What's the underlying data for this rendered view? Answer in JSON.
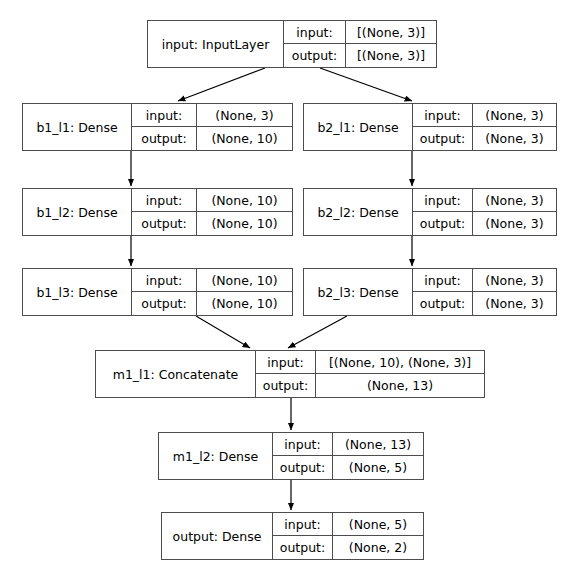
{
  "diagram": {
    "type": "keras-model-graph",
    "background_color": "#ffffff",
    "border_color": "#4d4d4d",
    "text_color": "#000000",
    "io_labels": {
      "input": "input:",
      "output": "output:"
    },
    "nodes": [
      {
        "id": "input",
        "name": "input: InputLayer",
        "input_shape": "[(None, 3)]",
        "output_shape": "[(None, 3)]",
        "x": 147,
        "y": 20,
        "w": 290,
        "h": 48,
        "name_w": 136,
        "label_w": 62
      },
      {
        "id": "b1_l1",
        "name": "b1_l1: Dense",
        "input_shape": "(None, 3)",
        "output_shape": "(None, 10)",
        "x": 22,
        "y": 103,
        "w": 271,
        "h": 48,
        "name_w": 109,
        "label_w": 65
      },
      {
        "id": "b2_l1",
        "name": "b2_l1: Dense",
        "input_shape": "(None, 3)",
        "output_shape": "(None, 3)",
        "x": 303,
        "y": 103,
        "w": 254,
        "h": 48,
        "name_w": 109,
        "label_w": 60
      },
      {
        "id": "b1_l2",
        "name": "b1_l2: Dense",
        "input_shape": "(None, 10)",
        "output_shape": "(None, 10)",
        "x": 22,
        "y": 188,
        "w": 271,
        "h": 48,
        "name_w": 109,
        "label_w": 65
      },
      {
        "id": "b2_l2",
        "name": "b2_l2: Dense",
        "input_shape": "(None, 3)",
        "output_shape": "(None, 3)",
        "x": 303,
        "y": 188,
        "w": 254,
        "h": 48,
        "name_w": 109,
        "label_w": 60
      },
      {
        "id": "b1_l3",
        "name": "b1_l3: Dense",
        "input_shape": "(None, 10)",
        "output_shape": "(None, 10)",
        "x": 22,
        "y": 268,
        "w": 271,
        "h": 48,
        "name_w": 109,
        "label_w": 65
      },
      {
        "id": "b2_l3",
        "name": "b2_l3: Dense",
        "input_shape": "(None, 3)",
        "output_shape": "(None, 3)",
        "x": 303,
        "y": 268,
        "w": 254,
        "h": 48,
        "name_w": 109,
        "label_w": 60
      },
      {
        "id": "m1_l1",
        "name": "m1_l1: Concatenate",
        "input_shape": "[(None, 10), (None, 3)]",
        "output_shape": "(None, 13)",
        "x": 95,
        "y": 350,
        "w": 390,
        "h": 48,
        "name_w": 160,
        "label_w": 60
      },
      {
        "id": "m1_l2",
        "name": "m1_l2: Dense",
        "input_shape": "(None, 13)",
        "output_shape": "(None, 5)",
        "x": 158,
        "y": 432,
        "w": 266,
        "h": 48,
        "name_w": 114,
        "label_w": 60
      },
      {
        "id": "output",
        "name": "output: Dense",
        "input_shape": "(None, 5)",
        "output_shape": "(None, 2)",
        "x": 161,
        "y": 512,
        "w": 263,
        "h": 48,
        "name_w": 111,
        "label_w": 60
      }
    ],
    "edges": [
      {
        "from": "input",
        "to": "b1_l1",
        "x1": 265,
        "y1": 68,
        "x2": 178,
        "y2": 101
      },
      {
        "from": "input",
        "to": "b2_l1",
        "x1": 320,
        "y1": 68,
        "x2": 412,
        "y2": 101
      },
      {
        "from": "b1_l1",
        "to": "b1_l2",
        "x1": 131,
        "y1": 151,
        "x2": 131,
        "y2": 186
      },
      {
        "from": "b2_l1",
        "to": "b2_l2",
        "x1": 412,
        "y1": 151,
        "x2": 412,
        "y2": 186
      },
      {
        "from": "b1_l2",
        "to": "b1_l3",
        "x1": 131,
        "y1": 236,
        "x2": 131,
        "y2": 266
      },
      {
        "from": "b2_l2",
        "to": "b2_l3",
        "x1": 412,
        "y1": 236,
        "x2": 412,
        "y2": 266
      },
      {
        "from": "b1_l3",
        "to": "m1_l1",
        "x1": 196,
        "y1": 316,
        "x2": 250,
        "y2": 348
      },
      {
        "from": "b2_l3",
        "to": "m1_l1",
        "x1": 347,
        "y1": 316,
        "x2": 288,
        "y2": 348
      },
      {
        "from": "m1_l1",
        "to": "m1_l2",
        "x1": 291,
        "y1": 398,
        "x2": 291,
        "y2": 430
      },
      {
        "from": "m1_l2",
        "to": "output",
        "x1": 291,
        "y1": 480,
        "x2": 291,
        "y2": 510
      }
    ]
  }
}
